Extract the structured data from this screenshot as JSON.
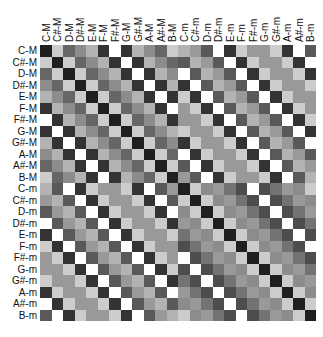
{
  "chart_data": {
    "type": "heatmap",
    "title": "",
    "xlabel": "",
    "ylabel": "",
    "labels": [
      "C-M",
      "C#-M",
      "D-M",
      "D#-M",
      "E-M",
      "F-M",
      "F#-M",
      "G-M",
      "G#-M",
      "A-M",
      "A#-M",
      "B-M",
      "C-m",
      "C#-m",
      "D-m",
      "D#-m",
      "E-m",
      "F-m",
      "F#-m",
      "G-m",
      "G#-m",
      "A-m",
      "A#-m",
      "B-m"
    ],
    "colormap": "gray (dark = low, white = high)",
    "note": "Circulant structure: each block row is a cyclic shift of the base row below (values are normalized gray intensity 0=black,1=white)",
    "base_rows": {
      "major_vs_major": [
        0.12,
        0.8,
        0.4,
        0.55,
        0.7,
        0.2,
        1.0,
        0.2,
        0.7,
        0.55,
        0.4,
        0.8
      ],
      "major_vs_minor": [
        0.7,
        0.6,
        0.35,
        1.0,
        0.2,
        0.8,
        0.6,
        0.6,
        0.8,
        0.2,
        1.0,
        0.35
      ],
      "minor_vs_minor": [
        0.12,
        0.8,
        0.55,
        0.6,
        0.45,
        0.3,
        1.0,
        0.3,
        0.45,
        0.6,
        0.55,
        0.8
      ]
    },
    "xlim": [
      0,
      24
    ],
    "ylim": [
      0,
      24
    ],
    "grid": false,
    "legend": "none"
  }
}
